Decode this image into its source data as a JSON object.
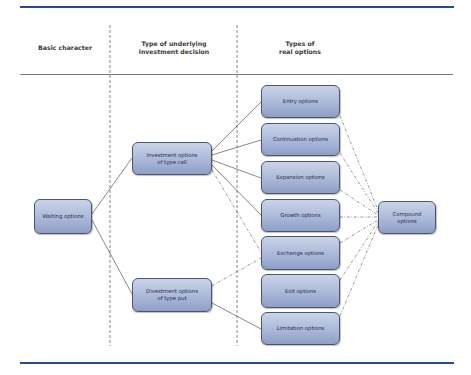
{
  "columns": {
    "basic_character": "Basic character",
    "underlying_decision_line1": "Type of underlying",
    "underlying_decision_line2": "investment decision",
    "real_options_line1": "Types of",
    "real_options_line2": "real options"
  },
  "nodes": {
    "waiting": "Waiting options",
    "investment_line1": "Investment options",
    "investment_line2": "of type call",
    "divestment_line1": "Divestment options",
    "divestment_line2": "of type put",
    "entry": "Entry options",
    "continuation": "Continuation options",
    "expansion": "Expansion options",
    "growth": "Growth options",
    "exchange": "Exchange options",
    "exit": "Exit options",
    "limitation": "Limitation options",
    "compound_line1": "Compound",
    "compound_line2": "options"
  },
  "edges": [
    {
      "from": "Waiting options",
      "to": "Investment options of type call",
      "style": "solid"
    },
    {
      "from": "Waiting options",
      "to": "Divestment options of type put",
      "style": "solid"
    },
    {
      "from": "Investment options of type call",
      "to": "Entry options",
      "style": "solid"
    },
    {
      "from": "Investment options of type call",
      "to": "Continuation options",
      "style": "solid"
    },
    {
      "from": "Investment options of type call",
      "to": "Expansion options",
      "style": "solid"
    },
    {
      "from": "Investment options of type call",
      "to": "Growth options",
      "style": "solid"
    },
    {
      "from": "Investment options of type call",
      "to": "Exchange options",
      "style": "dash-dot"
    },
    {
      "from": "Divestment options of type put",
      "to": "Exchange options",
      "style": "dash-dot"
    },
    {
      "from": "Divestment options of type put",
      "to": "Limitation options",
      "style": "solid"
    },
    {
      "from": "Entry options",
      "to": "Compound options",
      "style": "dash-dot"
    },
    {
      "from": "Continuation options",
      "to": "Compound options",
      "style": "dash-dot"
    },
    {
      "from": "Expansion options",
      "to": "Compound options",
      "style": "dash-dot"
    },
    {
      "from": "Growth options",
      "to": "Compound options",
      "style": "dash-dot"
    },
    {
      "from": "Exchange options",
      "to": "Compound options",
      "style": "dash-dot"
    },
    {
      "from": "Exit options",
      "to": "Compound options",
      "style": "dash-dot"
    },
    {
      "from": "Limitation options",
      "to": "Compound options",
      "style": "dash-dot"
    }
  ],
  "colors": {
    "rule": "#2a4a8f",
    "node_border": "#4d5670",
    "node_fill_top": "#cbd3e8",
    "node_fill_bottom": "#8e9fc7",
    "line": "#555555"
  }
}
